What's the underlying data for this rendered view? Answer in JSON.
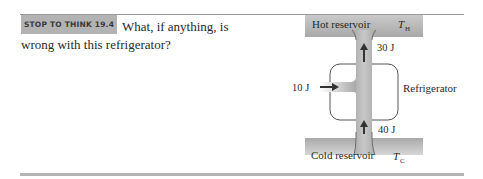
{
  "box": {
    "label": "STOP TO THINK 19.4",
    "question": "What, if anything, is wrong with this refrigerator?"
  },
  "diagram": {
    "hot_reservoir_label": "Hot reservoir",
    "hot_temp_symbol": "T",
    "hot_temp_subscript": "H",
    "cold_reservoir_label": "Cold reservoir",
    "cold_temp_symbol": "T",
    "cold_temp_subscript": "C",
    "device_label": "Refrigerator",
    "heat_out_label": "30 J",
    "work_in_label": "10 J",
    "heat_in_label": "40 J"
  }
}
